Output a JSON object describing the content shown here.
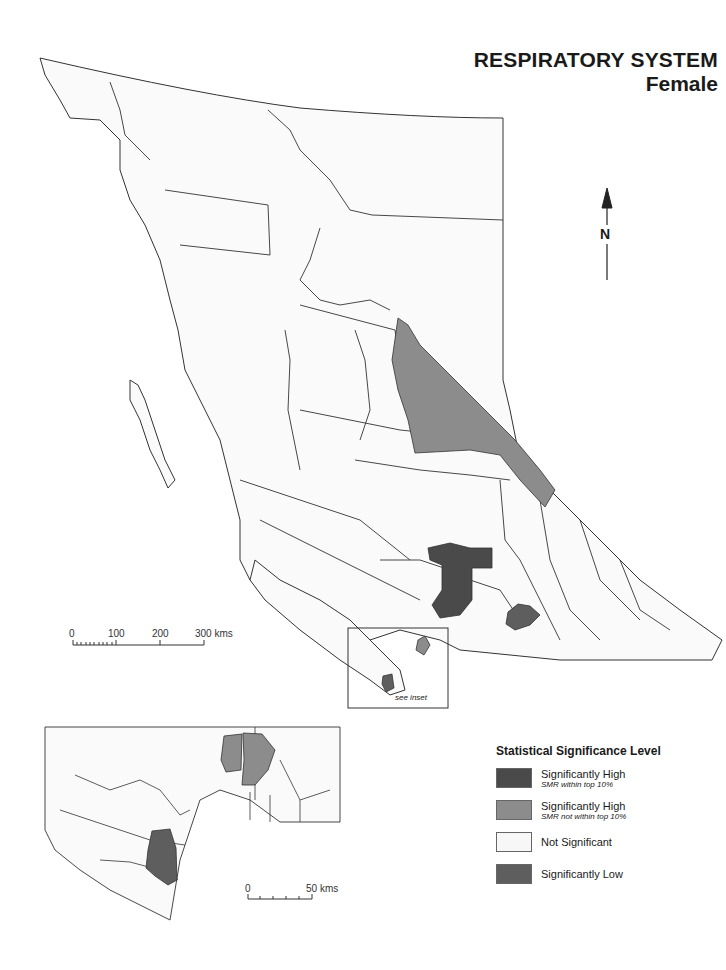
{
  "title": {
    "main": "RESPIRATORY SYSTEM",
    "subtitle": "Female"
  },
  "north_arrow": {
    "label": "N",
    "icon": "north-arrow-icon"
  },
  "main_scale": {
    "ticks": [
      "0",
      "100",
      "200",
      "300 kms"
    ]
  },
  "inset_scale": {
    "ticks": [
      "0",
      "50 kms"
    ]
  },
  "inset_note": "see inset",
  "legend": {
    "heading": "Statistical Significance Level",
    "items": [
      {
        "label": "Significantly High",
        "sub": "SMR within top 10%",
        "color": "#4a4a4a"
      },
      {
        "label": "Significantly High",
        "sub": "SMR not within top 10%",
        "color": "#8c8c8c"
      },
      {
        "label": "Not Significant",
        "sub": "",
        "color": "#f7f7f7"
      },
      {
        "label": "Significantly Low",
        "sub": "",
        "color": "#5e5e5e"
      }
    ]
  },
  "colors": {
    "outline": "#333333",
    "land": "#fafafa",
    "high_top10": "#4a4a4a",
    "high": "#8c8c8c",
    "low": "#5e5e5e"
  }
}
